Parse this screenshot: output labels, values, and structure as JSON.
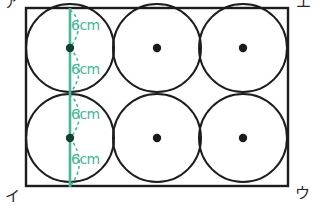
{
  "figure": {
    "colors": {
      "outline": "#1d1d1d",
      "measure": "#45b79a",
      "center_dot": "#1a1a1a",
      "background": "#ffffff"
    },
    "rectangle": {
      "x": 26,
      "y": 8,
      "width": 262,
      "height": 178,
      "stroke_width": 2.4
    },
    "circle_radius": 44,
    "circles": [
      {
        "name": "circle-top-left",
        "cx": 70,
        "cy": 48
      },
      {
        "name": "circle-top-middle",
        "cx": 157,
        "cy": 48
      },
      {
        "name": "circle-top-right",
        "cx": 243,
        "cy": 48
      },
      {
        "name": "circle-bottom-left",
        "cx": 70,
        "cy": 138
      },
      {
        "name": "circle-bottom-middle",
        "cx": 157,
        "cy": 138
      },
      {
        "name": "circle-bottom-right",
        "cx": 243,
        "cy": 138
      }
    ],
    "measure_line": {
      "x": 70,
      "y1": 8,
      "y2": 186
    },
    "measure_ticks": [
      8,
      48,
      93,
      138,
      186
    ],
    "corner_labels": {
      "top_left": "ア",
      "top_right": "エ",
      "bottom_left": "イ",
      "bottom_right": "ウ"
    },
    "measure_labels": {
      "segment_1": "6cm",
      "segment_2": "6cm",
      "segment_3": "6cm",
      "segment_4": "6cm"
    }
  }
}
